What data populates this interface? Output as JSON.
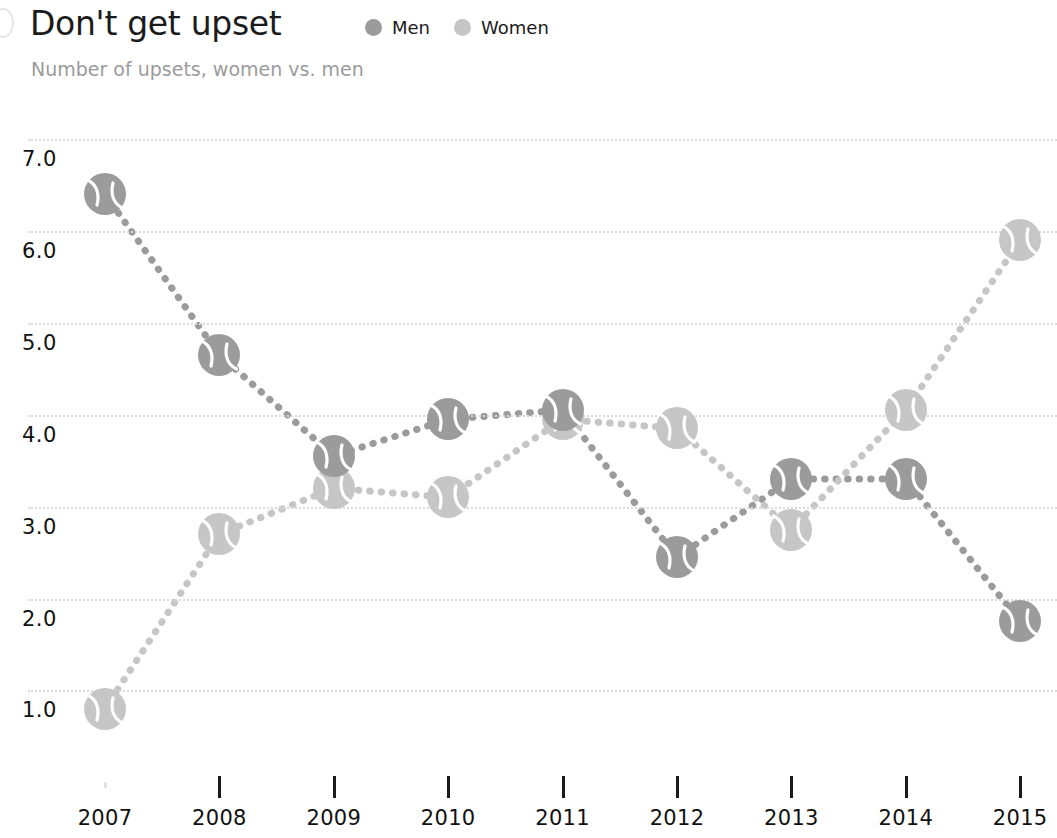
{
  "header": {
    "title": "Don't get upset",
    "subtitle": "Number of upsets, women vs. men"
  },
  "legend": {
    "position": "top-right-of-title",
    "items": [
      {
        "label": "Men",
        "color": "#9b9b9b",
        "icon": "circle-icon"
      },
      {
        "label": "Women",
        "color": "#c6c6c6",
        "icon": "circle-icon"
      }
    ]
  },
  "axes": {
    "y_ticks": [
      "7.0",
      "6.0",
      "5.0",
      "4.0",
      "3.0",
      "2.0",
      "1.0"
    ],
    "x_ticks": [
      "2007",
      "2008",
      "2009",
      "2010",
      "2011",
      "2012",
      "2013",
      "2014",
      "2015"
    ]
  },
  "chart_data": {
    "type": "line",
    "title": "Don't get upset",
    "subtitle": "Number of upsets, women vs. men",
    "xlabel": "",
    "ylabel": "",
    "categories": [
      "2007",
      "2008",
      "2009",
      "2010",
      "2011",
      "2012",
      "2013",
      "2014",
      "2015"
    ],
    "x": [
      2007,
      2008,
      2009,
      2010,
      2011,
      2012,
      2013,
      2014,
      2015
    ],
    "ylim": [
      0.5,
      7.3
    ],
    "yticks": [
      1.0,
      2.0,
      3.0,
      4.0,
      5.0,
      6.0,
      7.0
    ],
    "grid": "horizontal-dotted",
    "legend_position": "top",
    "marker": "tennis-ball",
    "line_style": "dotted",
    "series": [
      {
        "name": "Men",
        "color": "#9b9b9b",
        "values": [
          6.4,
          4.65,
          3.55,
          3.95,
          4.05,
          2.45,
          3.3,
          3.3,
          1.75
        ]
      },
      {
        "name": "Women",
        "color": "#c6c6c6",
        "values": [
          0.8,
          2.7,
          3.2,
          3.1,
          3.95,
          3.85,
          2.75,
          4.05,
          5.9
        ]
      }
    ]
  }
}
